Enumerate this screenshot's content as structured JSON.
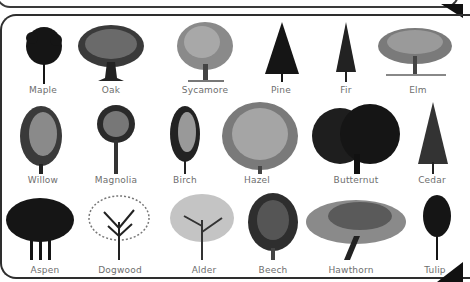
{
  "rows": [
    {
      "items": [
        {
          "name": "Maple",
          "label_x": 43,
          "style": "dense-dark-round"
        },
        {
          "name": "Oak",
          "label_x": 111,
          "style": "broad-spreading"
        },
        {
          "name": "Sycamore",
          "label_x": 205,
          "style": "sketch-grey-broad"
        },
        {
          "name": "Pine",
          "label_x": 281,
          "style": "conifer-dark"
        },
        {
          "name": "Fir",
          "label_x": 346,
          "style": "conifer-narrow"
        },
        {
          "name": "Elm",
          "label_x": 418,
          "style": "weeping-wide"
        }
      ]
    },
    {
      "items": [
        {
          "name": "Willow",
          "label_x": 43,
          "style": "weeping-tall"
        },
        {
          "name": "Magnolia",
          "label_x": 116,
          "style": "round-crown"
        },
        {
          "name": "Birch",
          "label_x": 185,
          "style": "narrow-oval"
        },
        {
          "name": "Hazel",
          "label_x": 257,
          "style": "bushy-grey"
        },
        {
          "name": "Butternut",
          "label_x": 356,
          "style": "broad-dark"
        },
        {
          "name": "Cedar",
          "label_x": 432,
          "style": "conifer-cone"
        }
      ]
    },
    {
      "items": [
        {
          "name": "Aspen",
          "label_x": 45,
          "style": "grove-dark"
        },
        {
          "name": "Dogwood",
          "label_x": 120,
          "style": "open-branching"
        },
        {
          "name": "Alder",
          "label_x": 204,
          "style": "open-light"
        },
        {
          "name": "Beech",
          "label_x": 273,
          "style": "dense-oval"
        },
        {
          "name": "Hawthorn",
          "label_x": 351,
          "style": "leaning-wide"
        },
        {
          "name": "Tulip",
          "label_x": 435,
          "style": "columnar-dark"
        }
      ]
    }
  ],
  "colors": {
    "frame": "#2e2e2e",
    "label": "#6e6e6e",
    "tree_dark": "#151515",
    "tree_mid": "#4a4a4a",
    "tree_light": "#8a8a8a"
  }
}
